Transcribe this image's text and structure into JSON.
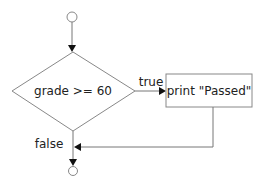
{
  "diagram": {
    "type": "flowchart",
    "decision": {
      "label": "grade >= 60"
    },
    "action": {
      "label": "print \"Passed\""
    },
    "edges": {
      "true_label": "true",
      "false_label": "false"
    },
    "colors": {
      "line": "#777777",
      "arrow": "#111111",
      "text": "#222222",
      "background": "#ffffff"
    }
  }
}
